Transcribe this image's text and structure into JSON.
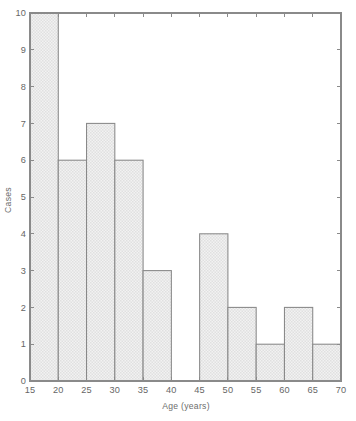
{
  "chart_data": {
    "type": "bar",
    "title": "",
    "subtitle": "",
    "xlabel": "Age (years)",
    "ylabel": "Cases",
    "xlim": [
      15,
      70
    ],
    "ylim": [
      0,
      10
    ],
    "bin_width": 5,
    "grid": false,
    "legend": null,
    "categories": [
      "15-20",
      "20-25",
      "25-30",
      "30-35",
      "35-40",
      "40-45",
      "45-50",
      "50-55",
      "55-60",
      "60-65",
      "65-70"
    ],
    "bin_starts": [
      15,
      20,
      25,
      30,
      35,
      40,
      45,
      50,
      55,
      60,
      65
    ],
    "values": [
      10,
      6,
      7,
      6,
      3,
      0,
      4,
      2,
      1,
      2,
      1
    ],
    "xticks": [
      15,
      20,
      25,
      30,
      35,
      40,
      45,
      50,
      55,
      60,
      65,
      70
    ],
    "xtick_labels": [
      "15",
      "20",
      "25",
      "30",
      "35",
      "40",
      "45",
      "50",
      "55",
      "60",
      "65",
      "70"
    ],
    "yticks": [
      0,
      1,
      2,
      3,
      4,
      5,
      6,
      7,
      8,
      9,
      10
    ],
    "ytick_labels": [
      "0",
      "1",
      "2",
      "3",
      "4",
      "5",
      "6",
      "7",
      "8",
      "9",
      "10"
    ],
    "total_cases": 42,
    "colors": {
      "background": "#ffffff",
      "bar_fill": "#ededed",
      "bar_edge": "#888888",
      "axis": "#8a8a8a",
      "text": "#666666"
    }
  }
}
